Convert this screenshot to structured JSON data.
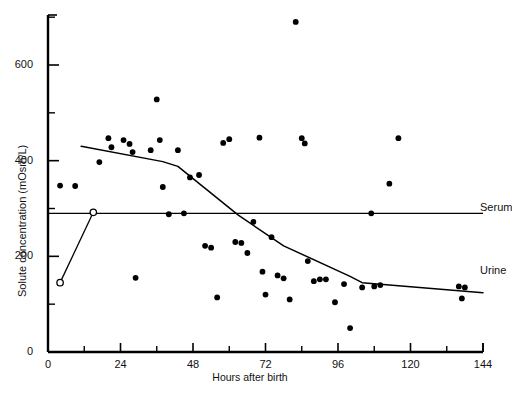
{
  "chart_data": {
    "type": "scatter",
    "title": "",
    "xlabel": "Hours after birth",
    "ylabel": "Solute concentration (mOsm/L)",
    "xlim": [
      0,
      144
    ],
    "ylim": [
      0,
      705
    ],
    "grid": false,
    "legend_position": "inline-right",
    "x_major_ticks": [
      0,
      24,
      48,
      72,
      96,
      120,
      144
    ],
    "x_minor_ticks": [
      12,
      36,
      60,
      84,
      108,
      132
    ],
    "x_tick_labels": [
      "0",
      "24",
      "48",
      "72",
      "96",
      "120",
      "144"
    ],
    "y_major_ticks": [
      0,
      200,
      400,
      600
    ],
    "y_minor_ticks": [
      100,
      300,
      500,
      700
    ],
    "y_tick_labels": [
      "0",
      "200",
      "400",
      "600"
    ],
    "series": [
      {
        "name": "Urine",
        "label": "Urine",
        "type": "scatter",
        "marker": "filled-circle",
        "color": "#000000",
        "points": [
          [
            4,
            348
          ],
          [
            9,
            347
          ],
          [
            17,
            397
          ],
          [
            20,
            447
          ],
          [
            21,
            428
          ],
          [
            25,
            443
          ],
          [
            27,
            435
          ],
          [
            28,
            418
          ],
          [
            29,
            155
          ],
          [
            34,
            422
          ],
          [
            36,
            528
          ],
          [
            37,
            443
          ],
          [
            38,
            345
          ],
          [
            40,
            288
          ],
          [
            43,
            422
          ],
          [
            45,
            290
          ],
          [
            47,
            365
          ],
          [
            50,
            370
          ],
          [
            52,
            222
          ],
          [
            54,
            218
          ],
          [
            56,
            114
          ],
          [
            58,
            437
          ],
          [
            60,
            445
          ],
          [
            62,
            230
          ],
          [
            64,
            228
          ],
          [
            66,
            207
          ],
          [
            68,
            272
          ],
          [
            70,
            448
          ],
          [
            71,
            168
          ],
          [
            72,
            120
          ],
          [
            74,
            240
          ],
          [
            76,
            160
          ],
          [
            78,
            154
          ],
          [
            80,
            110
          ],
          [
            82,
            690
          ],
          [
            84,
            447
          ],
          [
            85,
            436
          ],
          [
            86,
            190
          ],
          [
            88,
            148
          ],
          [
            90,
            152
          ],
          [
            92,
            152
          ],
          [
            95,
            104
          ],
          [
            98,
            142
          ],
          [
            100,
            50
          ],
          [
            104,
            135
          ],
          [
            107,
            290
          ],
          [
            108,
            137
          ],
          [
            110,
            140
          ],
          [
            113,
            352
          ],
          [
            116,
            447
          ],
          [
            136,
            137
          ],
          [
            138,
            135
          ],
          [
            137,
            112
          ]
        ]
      },
      {
        "name": "Urine trend",
        "label": "Urine",
        "type": "line",
        "color": "#000000",
        "vertices": [
          [
            11,
            430
          ],
          [
            38,
            398
          ],
          [
            43,
            388
          ],
          [
            63,
            286
          ],
          [
            78,
            222
          ],
          [
            100,
            158
          ],
          [
            104,
            145
          ],
          [
            144,
            124
          ]
        ]
      },
      {
        "name": "Serum",
        "label": "Serum",
        "type": "line",
        "color": "#000000",
        "vertices": [
          [
            0,
            290
          ],
          [
            144,
            290
          ]
        ]
      },
      {
        "name": "Open-circle series",
        "label": "",
        "type": "line-marker",
        "marker": "open-circle",
        "color": "#000000",
        "points": [
          [
            4,
            145
          ],
          [
            15,
            292
          ]
        ]
      }
    ],
    "annotations": [
      {
        "text": "Serum",
        "x": 146,
        "y": 300
      },
      {
        "text": "Urine",
        "x": 146,
        "y": 168
      }
    ]
  },
  "axis": {
    "x_title": "Hours after birth",
    "y_title": "Solute concentration (mOsm/L)"
  },
  "labels": {
    "serum": "Serum",
    "urine": "Urine"
  }
}
